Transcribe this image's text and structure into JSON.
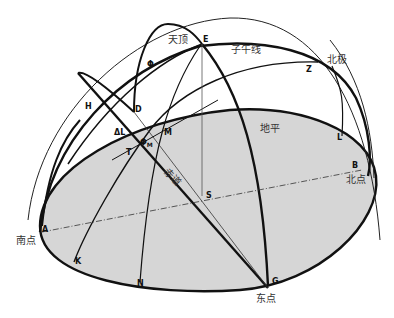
{
  "diagram": {
    "colors": {
      "horizon_fill": "#d6d6d6",
      "line": "#111111",
      "background": "#ffffff"
    },
    "region_labels": {
      "zenith": "天顶",
      "meridian": "子午线",
      "north_pole": "北极",
      "horizon": "地平",
      "equator": "赤道",
      "south_point": "南点",
      "north_point": "北点",
      "east_point": "东点"
    },
    "points": {
      "E": "E",
      "Z": "Z",
      "Phi": "Φ",
      "H": "H",
      "D": "D",
      "DeltaL": "ΔL",
      "M": "M",
      "PhiM": "Φ",
      "PhiM_sub": "M",
      "T": "T",
      "S": "S",
      "L": "L",
      "B": "B",
      "A": "A",
      "K": "K",
      "N": "N",
      "G": "G"
    }
  }
}
